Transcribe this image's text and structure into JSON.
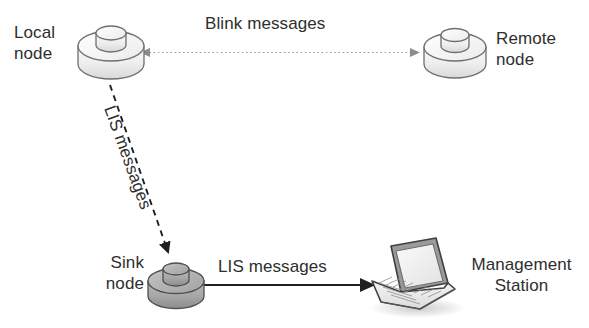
{
  "diagram": {
    "background_color": "#ffffff",
    "nodes": [
      {
        "id": "local-node",
        "label": "Local\nnode",
        "icon": "disk-node-icon",
        "fill_color": "#f2f2f2",
        "stroke_color": "#6b6b6b"
      },
      {
        "id": "remote-node",
        "label": "Remote\nnode",
        "icon": "disk-node-icon",
        "fill_color": "#f2f2f2",
        "stroke_color": "#6b6b6b"
      },
      {
        "id": "sink-node",
        "label": "Sink\nnode",
        "icon": "disk-node-icon",
        "fill_color": "#a9a9a9",
        "stroke_color": "#4a4a4a"
      },
      {
        "id": "management-station",
        "label": "Management\nStation",
        "icon": "laptop-icon",
        "fill_color": "#e8e8e8",
        "stroke_color": "#4a4a4a"
      }
    ],
    "edges": [
      {
        "id": "blink-edge",
        "label": "Blink messages",
        "from": "local-node",
        "to": "remote-node",
        "style": "dotted",
        "arrowheads": "both",
        "color": "#909090"
      },
      {
        "id": "lis-local-to-sink-edge",
        "label": "LIS messages",
        "from": "local-node",
        "to": "sink-node",
        "style": "dashed",
        "arrowheads": "end",
        "color": "#1f1f1f"
      },
      {
        "id": "lis-sink-to-station-edge",
        "label": "LIS messages",
        "from": "sink-node",
        "to": "management-station",
        "style": "solid",
        "arrowheads": "end",
        "color": "#1f1f1f"
      }
    ],
    "labels": {
      "local_node": "Local\nnode",
      "remote_node": "Remote\nnode",
      "sink_node": "Sink\nnode",
      "management_station": "Management\nStation",
      "blink_messages": "Blink messages",
      "lis_messages_diagonal": "LIS messages",
      "lis_messages_bottom": "LIS messages"
    }
  }
}
